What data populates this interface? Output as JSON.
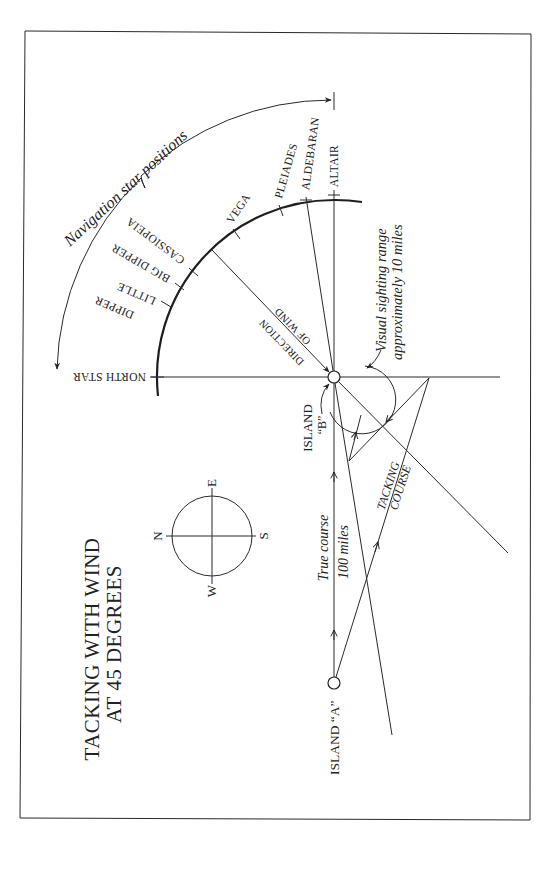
{
  "title": {
    "line1": "TACKING WITH WIND",
    "line2": "AT 45 DEGREES"
  },
  "stars": {
    "group_label": "Navigation star positions",
    "items": [
      {
        "name": "NORTH STAR"
      },
      {
        "name": "LITTLE",
        "name2": "DIPPER"
      },
      {
        "name": "BIG DIPPER"
      },
      {
        "name": "CASSIOPEIA"
      },
      {
        "name": "VEGA"
      },
      {
        "name": "PLEIADES"
      },
      {
        "name": "ALDEBARAN"
      },
      {
        "name": "ALTAIR"
      }
    ]
  },
  "wind": {
    "line1": "DIRECTION",
    "line2": "OF WIND"
  },
  "islands": {
    "a": "ISLAND “A”",
    "b_line1": "ISLAND",
    "b_line2": "“B”"
  },
  "courses": {
    "true_line1": "True course",
    "true_line2": "100 miles",
    "tacking_line1": "TACKING",
    "tacking_line2": "COURSE"
  },
  "sighting": {
    "line1": "Visual sighting range",
    "line2": "approximately 10 miles"
  },
  "compass": {
    "n": "N",
    "e": "E",
    "s": "S",
    "w": "W"
  },
  "colors": {
    "ink": "#222222",
    "paper": "#ffffff"
  }
}
